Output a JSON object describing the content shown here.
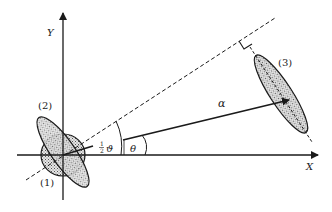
{
  "diagram": {
    "axes": {
      "x_label": "X",
      "y_label": "Y"
    },
    "angles": {
      "half_vartheta_label_num": "1",
      "half_vartheta_label_den": "2",
      "half_vartheta_symbol": "ϑ",
      "theta_label": "θ"
    },
    "vector": {
      "label": "α"
    },
    "ellipses": [
      {
        "id": "1",
        "label": "(1)"
      },
      {
        "id": "2",
        "label": "(2)"
      },
      {
        "id": "3",
        "label": "(3)"
      }
    ],
    "colors": {
      "stroke": "#1a1a1a",
      "fill_stipple": "#bdbdbd",
      "background": "#ffffff"
    }
  }
}
